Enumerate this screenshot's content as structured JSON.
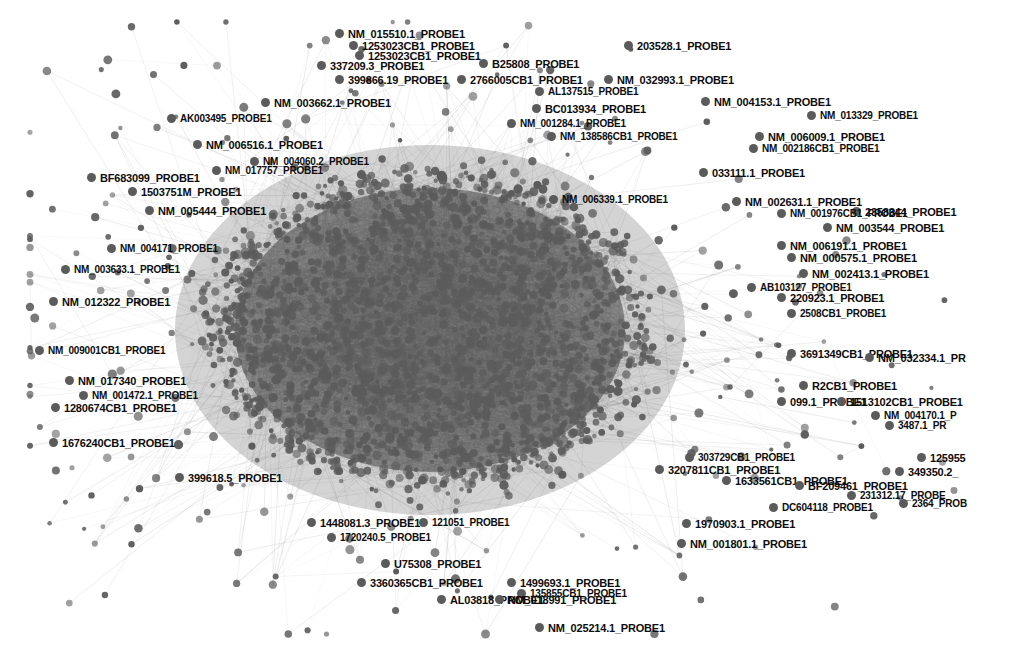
{
  "graph": {
    "type": "force-directed-network",
    "background": "#ffffff",
    "node_color": "#5b5b5b",
    "core_color": "#3a3a3a",
    "edge_color": "#9a9a9a",
    "label_color": "#0d0d0d",
    "width": 1009,
    "height": 652,
    "node_count_estimate": 2400,
    "hub_center": [
      430,
      330
    ]
  },
  "labels": [
    {
      "text": "NM_015510.1_PROBE1",
      "x": 348,
      "y": 28,
      "size": 11
    },
    {
      "text": "1253023CB1_PROBE1",
      "x": 362,
      "y": 40,
      "size": 11
    },
    {
      "text": "1253023CB1_PROBE1",
      "x": 368,
      "y": 50,
      "size": 11
    },
    {
      "text": "203528.1_PROBE1",
      "x": 637,
      "y": 40,
      "size": 11
    },
    {
      "text": "337209.3_PROBE1",
      "x": 330,
      "y": 60,
      "size": 11
    },
    {
      "text": "B25808_PROBE1",
      "x": 492,
      "y": 58,
      "size": 11
    },
    {
      "text": "399866.19_PROBE1",
      "x": 348,
      "y": 74,
      "size": 11
    },
    {
      "text": "2766005CB1_PROBE1",
      "x": 470,
      "y": 74,
      "size": 11
    },
    {
      "text": "NM_032993.1_PROBE1",
      "x": 617,
      "y": 74,
      "size": 11
    },
    {
      "text": "AL137515_PROBE1",
      "x": 548,
      "y": 86,
      "size": 10
    },
    {
      "text": "NM_003662.1_PROBE1",
      "x": 274,
      "y": 97,
      "size": 11
    },
    {
      "text": "NM_004153.1_PROBE1",
      "x": 714,
      "y": 96,
      "size": 11
    },
    {
      "text": "BC013934_PROBE1",
      "x": 545,
      "y": 103,
      "size": 11
    },
    {
      "text": "NM_013329_PROBE1",
      "x": 820,
      "y": 110,
      "size": 10
    },
    {
      "text": "AK003495_PROBE1",
      "x": 180,
      "y": 113,
      "size": 10
    },
    {
      "text": "NM_001284.1_PROBE1",
      "x": 520,
      "y": 118,
      "size": 10
    },
    {
      "text": "NM_006009.1_PROBE1",
      "x": 768,
      "y": 131,
      "size": 11
    },
    {
      "text": "NM_006516.1_PROBE1",
      "x": 206,
      "y": 139,
      "size": 11
    },
    {
      "text": "NM_138586CB1_PROBE1",
      "x": 560,
      "y": 131,
      "size": 10
    },
    {
      "text": "NM_002186CB1_PROBE1",
      "x": 762,
      "y": 143,
      "size": 10
    },
    {
      "text": "NM_004060.2_PROBE1",
      "x": 263,
      "y": 156,
      "size": 10
    },
    {
      "text": "NM_017757_PROBE1",
      "x": 225,
      "y": 165,
      "size": 10
    },
    {
      "text": "033111.1_PROBE1",
      "x": 712,
      "y": 167,
      "size": 11
    },
    {
      "text": "BF683099_PROBE1",
      "x": 100,
      "y": 172,
      "size": 11
    },
    {
      "text": "1503751M_PROBE1",
      "x": 141,
      "y": 186,
      "size": 11
    },
    {
      "text": "NM_006339.1_PROBE1",
      "x": 562,
      "y": 194,
      "size": 10
    },
    {
      "text": "NM_002631.1_PROBE1",
      "x": 745,
      "y": 196,
      "size": 11
    },
    {
      "text": "NM_005444_PROBE1",
      "x": 158,
      "y": 205,
      "size": 11
    },
    {
      "text": "2358344_PROBE1",
      "x": 865,
      "y": 206,
      "size": 11
    },
    {
      "text": "NM_001976CB1_PROBE1",
      "x": 790,
      "y": 208,
      "size": 10
    },
    {
      "text": "NM_003544_PROBE1",
      "x": 836,
      "y": 222,
      "size": 11
    },
    {
      "text": "NM_006191.1_PROBE1",
      "x": 790,
      "y": 240,
      "size": 11
    },
    {
      "text": "NM_000575.1_PROBE1",
      "x": 800,
      "y": 252,
      "size": 11
    },
    {
      "text": "NM_002413.1_PROBE1",
      "x": 812,
      "y": 268,
      "size": 11
    },
    {
      "text": "NM_004171_PROBE1",
      "x": 120,
      "y": 243,
      "size": 10
    },
    {
      "text": "NM_003633.1_PROBE1",
      "x": 74,
      "y": 264,
      "size": 10
    },
    {
      "text": "AB103127_PROBE1",
      "x": 760,
      "y": 282,
      "size": 10
    },
    {
      "text": "NM_012322_PROBE1",
      "x": 62,
      "y": 296,
      "size": 11
    },
    {
      "text": "220923.1_PROBE1",
      "x": 790,
      "y": 292,
      "size": 11
    },
    {
      "text": "2508CB1_PROBE1",
      "x": 800,
      "y": 308,
      "size": 10
    },
    {
      "text": "NM_009001CB1_PROBE1",
      "x": 48,
      "y": 345,
      "size": 10
    },
    {
      "text": "3691349CB1_PROBE1",
      "x": 800,
      "y": 348,
      "size": 11
    },
    {
      "text": "NM_032334.1_PR",
      "x": 878,
      "y": 352,
      "size": 11
    },
    {
      "text": "NM_017340_PROBE1",
      "x": 78,
      "y": 375,
      "size": 11
    },
    {
      "text": "NM_001472.1_PROBE1",
      "x": 92,
      "y": 390,
      "size": 10
    },
    {
      "text": "R2CB1_PROBE1",
      "x": 812,
      "y": 380,
      "size": 11
    },
    {
      "text": "1280674CB1_PROBE1",
      "x": 64,
      "y": 402,
      "size": 11
    },
    {
      "text": "099.1_PROBE1",
      "x": 790,
      "y": 396,
      "size": 11
    },
    {
      "text": "1513102CB1_PROBE1",
      "x": 850,
      "y": 396,
      "size": 11
    },
    {
      "text": "NM_004170.1_P",
      "x": 884,
      "y": 410,
      "size": 10
    },
    {
      "text": "3487.1_PR",
      "x": 898,
      "y": 420,
      "size": 10
    },
    {
      "text": "1676240CB1_PROBE1",
      "x": 62,
      "y": 437,
      "size": 11
    },
    {
      "text": "303729CB1_PROBE1",
      "x": 698,
      "y": 452,
      "size": 10
    },
    {
      "text": "125955",
      "x": 930,
      "y": 452,
      "size": 11
    },
    {
      "text": "3207811CB1_PROBE1",
      "x": 668,
      "y": 464,
      "size": 11
    },
    {
      "text": "349350.2_",
      "x": 908,
      "y": 466,
      "size": 11
    },
    {
      "text": "399618.5_PROBE1",
      "x": 188,
      "y": 472,
      "size": 11
    },
    {
      "text": "1633561CB1_PROBE1",
      "x": 735,
      "y": 475,
      "size": 11
    },
    {
      "text": "BF209461_PROBE1",
      "x": 808,
      "y": 480,
      "size": 11
    },
    {
      "text": "231312.17_PROBE",
      "x": 860,
      "y": 490,
      "size": 10
    },
    {
      "text": "2364_PROB",
      "x": 912,
      "y": 498,
      "size": 10
    },
    {
      "text": "DC604118_PROBE1",
      "x": 782,
      "y": 502,
      "size": 10
    },
    {
      "text": "1448081.3_PROBE1",
      "x": 320,
      "y": 517,
      "size": 11
    },
    {
      "text": "121051_PROBE1",
      "x": 432,
      "y": 517,
      "size": 10
    },
    {
      "text": "1970903.1_PROBE1",
      "x": 695,
      "y": 518,
      "size": 11
    },
    {
      "text": "1720240.5_PROBE1",
      "x": 340,
      "y": 532,
      "size": 10
    },
    {
      "text": "NM_001801.1_PROBE1",
      "x": 690,
      "y": 538,
      "size": 11
    },
    {
      "text": "U75308_PROBE1",
      "x": 394,
      "y": 558,
      "size": 11
    },
    {
      "text": "3360365CB1_PROBE1",
      "x": 370,
      "y": 577,
      "size": 11
    },
    {
      "text": "1499693.1_PROBE1",
      "x": 520,
      "y": 577,
      "size": 11
    },
    {
      "text": "135855CB1_PROBE1",
      "x": 530,
      "y": 588,
      "size": 10
    },
    {
      "text": "AL03818_PROBE1",
      "x": 450,
      "y": 594,
      "size": 11
    },
    {
      "text": "NM_018991_PROBE1",
      "x": 508,
      "y": 594,
      "size": 11
    },
    {
      "text": "NM_025214.1_PROBE1",
      "x": 548,
      "y": 622,
      "size": 11
    }
  ]
}
